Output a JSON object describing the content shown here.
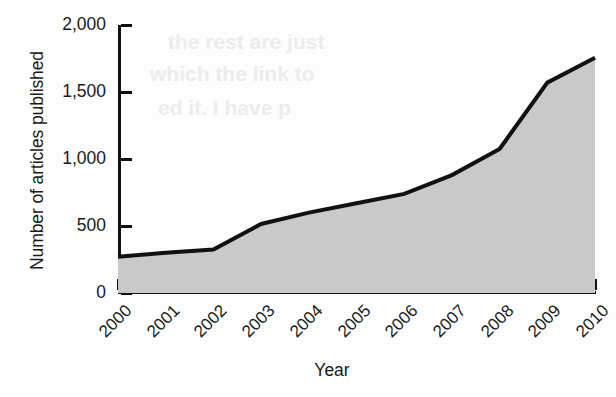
{
  "chart_data": {
    "type": "area",
    "title": "",
    "xlabel": "Year",
    "ylabel": "Number of articles published",
    "categories": [
      "2000",
      "2001",
      "2002",
      "2003",
      "2004",
      "2005",
      "2006",
      "2007",
      "2008",
      "2009",
      "2010"
    ],
    "values": [
      270,
      300,
      325,
      515,
      600,
      670,
      740,
      880,
      1075,
      1570,
      1755
    ],
    "series": [
      {
        "name": "Number of articles published",
        "values": [
          270,
          300,
          325,
          515,
          600,
          670,
          740,
          880,
          1075,
          1570,
          1755
        ]
      }
    ],
    "ylim": [
      0,
      2000
    ],
    "xlim": [
      2000,
      2010
    ],
    "ytick_labels": [
      "0",
      "500",
      "1,000",
      "1,500",
      "2,000"
    ],
    "ytick_values": [
      0,
      500,
      1000,
      1500,
      2000
    ],
    "grid": false,
    "legend": false,
    "legend_position": "none",
    "fill_color": "#c9c9c9",
    "line_color": "#111111",
    "background_color": "#ffffff",
    "xtick_label_rotation": -45
  },
  "artifacts": {
    "bleed_lines": [
      "the rest are just",
      "which the link to",
      "ed it. I have p"
    ]
  }
}
